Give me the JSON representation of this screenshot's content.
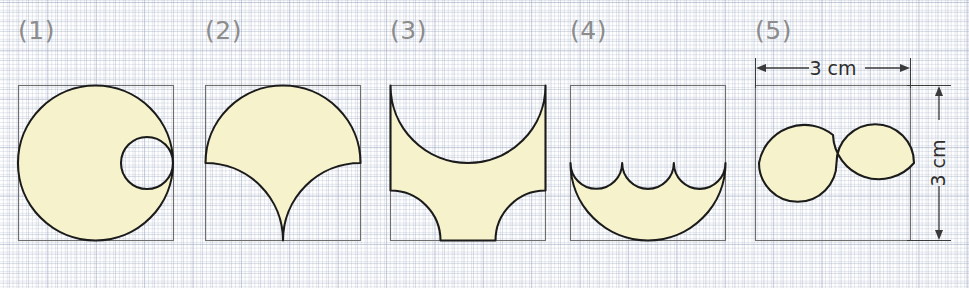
{
  "page": {
    "background": "#ffffff",
    "grid_color": "#aab4c8"
  },
  "style": {
    "fill_color": "#f6f3cc",
    "outline_color": "#1b1b1b",
    "square_color": "#6e6e6e",
    "label_color": "#8c8c8c",
    "dimension_color": "#3a3a3a"
  },
  "figures": [
    {
      "label": "(1)",
      "description": "Circle inscribed in square with smaller circle removed, internally tangent at the right",
      "square_side_px": 155,
      "shaded": true
    },
    {
      "label": "(2)",
      "description": "Upper semicircle with two quarter-circles removed from the bottom, meeting at a cusp",
      "square_side_px": 155,
      "shaded": true
    },
    {
      "label": "(3)",
      "description": "Square minus a top semicircle and two bottom corner quarter-circles",
      "square_side_px": 155,
      "shaded": true
    },
    {
      "label": "(4)",
      "description": "Large lower semicircle minus three small semicircles along its diameter",
      "square_side_px": 155,
      "shaded": true
    },
    {
      "label": "(5)",
      "description": "S-shaped yin-yang crescent region inside the square",
      "square_side_px": 155,
      "shaded": true,
      "dimensions": {
        "width_label": "3 cm",
        "height_label": "3 cm"
      }
    }
  ]
}
